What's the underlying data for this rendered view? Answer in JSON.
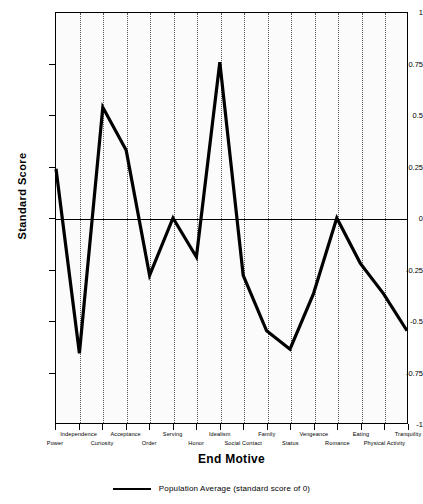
{
  "chart_data": {
    "type": "line",
    "title": "",
    "xlabel": "End Motive",
    "ylabel": "Standard Score",
    "ylim": [
      -1,
      1
    ],
    "grid": "vertical-dotted",
    "legend_position": "bottom",
    "categories": [
      "Power",
      "Independence",
      "Curiosity",
      "Acceptance",
      "Order",
      "Serving",
      "Honor",
      "Idealism",
      "Social Contact",
      "Family",
      "Status",
      "Vengeance",
      "Romance",
      "Eating",
      "Physical Activity",
      "Tranquility"
    ],
    "values": [
      0.24,
      -0.66,
      0.54,
      0.33,
      -0.28,
      0.0,
      -0.19,
      0.76,
      -0.28,
      -0.55,
      -0.64,
      -0.37,
      0.0,
      -0.22,
      -0.37,
      -0.55
    ],
    "ytick_labels": [
      "1",
      "0.75",
      "0.5",
      "0.25",
      "0",
      "-0.25",
      "-0.5",
      "-0.75",
      "-1"
    ],
    "ytick_values": [
      1,
      0.75,
      0.5,
      0.25,
      0,
      -0.25,
      -0.5,
      -0.75,
      -1
    ],
    "reference_line": {
      "value": 0,
      "label": "Population Average (standard score of 0)"
    },
    "series": [
      {
        "name": "End Motive standard score",
        "color": "#000000",
        "values": [
          0.24,
          -0.66,
          0.54,
          0.33,
          -0.28,
          0.0,
          -0.19,
          0.76,
          -0.28,
          -0.55,
          -0.64,
          -0.37,
          0.0,
          -0.22,
          -0.37,
          -0.55
        ]
      }
    ]
  },
  "legend": {
    "label": "Population Average (standard score of 0)"
  },
  "axes": {
    "x_title": "End Motive",
    "y_title": "Standard Score"
  }
}
